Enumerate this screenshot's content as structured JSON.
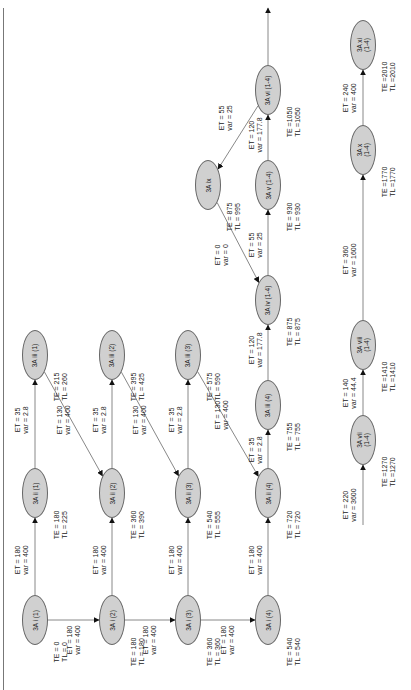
{
  "diagram": {
    "type": "activity-network",
    "orientation": "rotated-90-ccw",
    "nodes": [
      {
        "id": "i1",
        "label": "3A i (1)",
        "x": 35,
        "y": 620,
        "TE": "TE = 0",
        "TL": "TL = 0"
      },
      {
        "id": "i2",
        "label": "3A i (2)",
        "x": 112,
        "y": 620,
        "TE": "TE = 180",
        "TL": "TL = 180"
      },
      {
        "id": "i3",
        "label": "3A i (3)",
        "x": 188,
        "y": 620,
        "TE": "TE = 360",
        "TL": "TL = 360"
      },
      {
        "id": "i4",
        "label": "3A i (4)",
        "x": 268,
        "y": 620,
        "TE": "TE = 540",
        "TL": "TL = 540"
      },
      {
        "id": "ii1",
        "label": "3A ii (1)",
        "x": 35,
        "y": 493,
        "TE": "TE = 180",
        "TL": "TL = 225"
      },
      {
        "id": "ii2",
        "label": "3A ii (2)",
        "x": 112,
        "y": 493,
        "TE": "TE = 360",
        "TL": "TL = 390"
      },
      {
        "id": "ii3",
        "label": "3A ii (3)",
        "x": 188,
        "y": 493,
        "TE": "TE = 540",
        "TL": "TL = 555"
      },
      {
        "id": "ii4",
        "label": "3A ii (4)",
        "x": 268,
        "y": 493,
        "TE": "TE = 720",
        "TL": "TL = 720"
      },
      {
        "id": "iii1",
        "label": "3A iii (1)",
        "x": 35,
        "y": 355,
        "TE": "TE = 215",
        "TL": "TL = 260"
      },
      {
        "id": "iii2",
        "label": "3A iii (2)",
        "x": 112,
        "y": 355,
        "TE": "TE = 395",
        "TL": "TL = 425"
      },
      {
        "id": "iii3",
        "label": "3A iii (3)",
        "x": 188,
        "y": 355,
        "TE": "TE = 575",
        "TL": "TL = 590"
      },
      {
        "id": "iii4",
        "label": "3A iii (4)",
        "x": 268,
        "y": 405,
        "TE": "TE = 755",
        "TL": "TL = 755"
      },
      {
        "id": "iv",
        "label": "3A iv (1-4)",
        "x": 268,
        "y": 300,
        "TE": "TE = 875",
        "TL": "TL = 875"
      },
      {
        "id": "ix",
        "label": "3A ix",
        "x": 208,
        "y": 185,
        "TE": "TE = 875",
        "TL": "TL = 995"
      },
      {
        "id": "v",
        "label": "3A v (1-4)",
        "x": 268,
        "y": 185,
        "TE": "TE = 930",
        "TL": "TL = 930"
      },
      {
        "id": "vi",
        "label": "3A vi (1-4)",
        "x": 268,
        "y": 90,
        "TE": "TE =1050",
        "TL": "TL =1050"
      },
      {
        "id": "vii",
        "label": "3A vii\n(1-4)",
        "x": 363,
        "y": 440,
        "TE": "TE =1270",
        "TL": "TL =1270"
      },
      {
        "id": "viii",
        "label": "3A viii\n(1-4)",
        "x": 363,
        "y": 345,
        "TE": "TE =1410",
        "TL": "TL =1410"
      },
      {
        "id": "x",
        "label": "3A x\n(1-4)",
        "x": 363,
        "y": 150,
        "TE": "TE =1770",
        "TL": "TL =1770"
      },
      {
        "id": "xi",
        "label": "3A xi\n(1-4)",
        "x": 363,
        "y": 45,
        "TE": "TE =2010",
        "TL": "TL =2010"
      }
    ],
    "edges": [
      {
        "from": "i1",
        "to": "ii1",
        "ET": "ET = 180",
        "var": "var = 400",
        "lx": 22,
        "ly": 560
      },
      {
        "from": "i1",
        "to": "i2",
        "ET": "ET = 180",
        "var": "var = 400",
        "lx": 74,
        "ly": 640
      },
      {
        "from": "i2",
        "to": "ii2",
        "ET": "ET = 180",
        "var": "var = 400",
        "lx": 100,
        "ly": 560
      },
      {
        "from": "i2",
        "to": "i3",
        "ET": "ET = 180",
        "var": "var = 400",
        "lx": 150,
        "ly": 640
      },
      {
        "from": "i3",
        "to": "ii3",
        "ET": "ET = 180",
        "var": "var = 400",
        "lx": 176,
        "ly": 560
      },
      {
        "from": "i3",
        "to": "i4",
        "ET": "ET = 180",
        "var": "var = 400",
        "lx": 228,
        "ly": 640
      },
      {
        "from": "i4",
        "to": "ii4",
        "ET": "ET = 180",
        "var": "var = 400",
        "lx": 256,
        "ly": 560
      },
      {
        "from": "ii1",
        "to": "iii1",
        "ET": "ET = 35",
        "var": "var = 2.8",
        "lx": 22,
        "ly": 420
      },
      {
        "from": "ii2",
        "to": "iii2",
        "ET": "ET = 35",
        "var": "var = 2.8",
        "lx": 100,
        "ly": 420
      },
      {
        "from": "ii3",
        "to": "iii3",
        "ET": "ET = 35",
        "var": "var = 2.8",
        "lx": 176,
        "ly": 420
      },
      {
        "from": "ii4",
        "to": "iii4",
        "ET": "ET = 35",
        "var": "var = 2.8",
        "lx": 256,
        "ly": 450
      },
      {
        "from": "iii1",
        "to": "ii2",
        "ET": "ET = 130",
        "var": "var = 400",
        "lx": 64,
        "ly": 420
      },
      {
        "from": "iii2",
        "to": "ii3",
        "ET": "ET = 130",
        "var": "var = 400",
        "lx": 140,
        "ly": 420
      },
      {
        "from": "iii3",
        "to": "ii4",
        "ET": "ET = 130",
        "var": "var = 400",
        "lx": 222,
        "ly": 415
      },
      {
        "from": "iii4",
        "to": "iv",
        "ET": "ET = 120",
        "var": "var = 177.8",
        "lx": 256,
        "ly": 350
      },
      {
        "from": "ix",
        "to": "iv",
        "ET": "ET = 0",
        "var": "var = 0",
        "lx": 222,
        "ly": 255
      },
      {
        "from": "iv",
        "to": "v",
        "ET": "ET = 55",
        "var": "var = 25",
        "lx": 256,
        "ly": 245
      },
      {
        "from": "v",
        "to": "vi",
        "ET": "ET = 120",
        "var": "var = 177.8",
        "lx": 256,
        "ly": 135
      },
      {
        "from": "vi",
        "to": "ix",
        "ET": "ET = 55",
        "var": "var = 25",
        "lx": 226,
        "ly": 118
      },
      {
        "from": "vi",
        "to": "out",
        "ET": "",
        "var": "",
        "lx": 0,
        "ly": 0
      },
      {
        "from": "start",
        "to": "vii",
        "ET": "ET = 220",
        "var": "var = 3600",
        "lx": 350,
        "ly": 505
      },
      {
        "from": "vii",
        "to": "viii",
        "ET": "ET = 140",
        "var": "var = 44.4",
        "lx": 350,
        "ly": 393
      },
      {
        "from": "viii",
        "to": "x",
        "ET": "ET = 360",
        "var": "var = 1600",
        "lx": 350,
        "ly": 260
      },
      {
        "from": "x",
        "to": "xi",
        "ET": "ET = 240",
        "var": "var = 400",
        "lx": 350,
        "ly": 98
      }
    ]
  }
}
